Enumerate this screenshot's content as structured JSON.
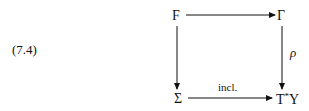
{
  "equation_number": "(7.4)",
  "nodes": {
    "top_left": "F",
    "top_right": "Γ",
    "bottom_left": "Σ",
    "bottom_right_base": "T",
    "bottom_right_sup": "*",
    "bottom_right_tail": "Y"
  },
  "arrows": {
    "top": {
      "from": "F",
      "to": "Γ",
      "label": ""
    },
    "left": {
      "from": "F",
      "to": "Σ",
      "label": ""
    },
    "right": {
      "from": "Γ",
      "to": "T*Y",
      "label": "ρ"
    },
    "bottom": {
      "from": "Σ",
      "to": "T*Y",
      "label": "incl."
    }
  }
}
